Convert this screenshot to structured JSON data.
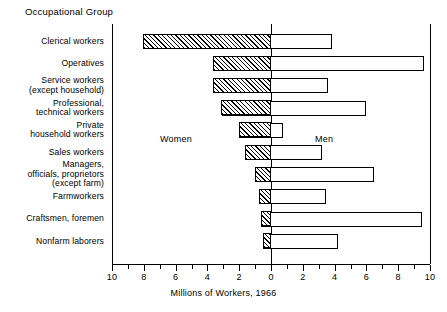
{
  "header": {
    "group_axis_title": "Occupational Group"
  },
  "annotations": {
    "women_label": "Women",
    "men_label": "Men"
  },
  "chart_data": {
    "type": "bar",
    "orientation": "horizontal",
    "subtype": "bidirectional-population-pyramid",
    "title": "Occupational Group",
    "xlabel": "Millions of Workers, 1966",
    "ylabel": "Occupational Group",
    "xlim": [
      -10,
      10
    ],
    "xticks": [
      -10,
      -8,
      -6,
      -4,
      -2,
      0,
      2,
      4,
      6,
      8,
      10
    ],
    "xticklabels": [
      "10",
      "8",
      "6",
      "4",
      "2",
      "0",
      "2",
      "4",
      "6",
      "8",
      "10"
    ],
    "minor_tick_step": 1,
    "grid": false,
    "legend": [
      "Women",
      "Men"
    ],
    "legend_position": "inside-plot",
    "categories": [
      "Clerical workers",
      "Operatives",
      "Service workers\n(except household)",
      "Professional,\ntechnical workers",
      "Private\nhousehold workers",
      "Sales workers",
      "Managers,\nofficials, proprietors\n(except farm)",
      "Farmworkers",
      "Craftsmen, foremen",
      "Nonfarm laborers"
    ],
    "series": [
      {
        "name": "Women",
        "direction": "left",
        "fill": "hatched",
        "values": [
          8.0,
          3.6,
          3.6,
          3.1,
          2.0,
          1.6,
          1.0,
          0.75,
          0.6,
          0.5
        ]
      },
      {
        "name": "Men",
        "direction": "right",
        "fill": "white",
        "values": [
          3.85,
          9.6,
          3.6,
          6.0,
          0.75,
          3.2,
          6.5,
          3.45,
          9.5,
          4.2
        ]
      }
    ]
  },
  "colors": {
    "stroke": "#000000",
    "background": "#ffffff",
    "hatch": "#000000"
  }
}
